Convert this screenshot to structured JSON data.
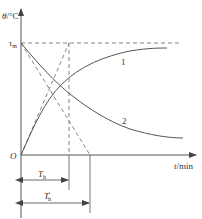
{
  "diagram": {
    "y_axis_label_var": "θ",
    "y_axis_label_unit": "/°C",
    "x_axis_label_var": "t",
    "x_axis_label_unit": "/min",
    "origin_label": "O",
    "tau_label": "τ",
    "tau_sub": "m",
    "curve1_label": "1",
    "curve2_label": "2",
    "th_label": "T",
    "th_sub": "h",
    "th_prime_label": "T",
    "th_prime_sup": "'",
    "th_prime_sub": "h",
    "colors": {
      "line": "#555555",
      "text": "#333333"
    }
  }
}
